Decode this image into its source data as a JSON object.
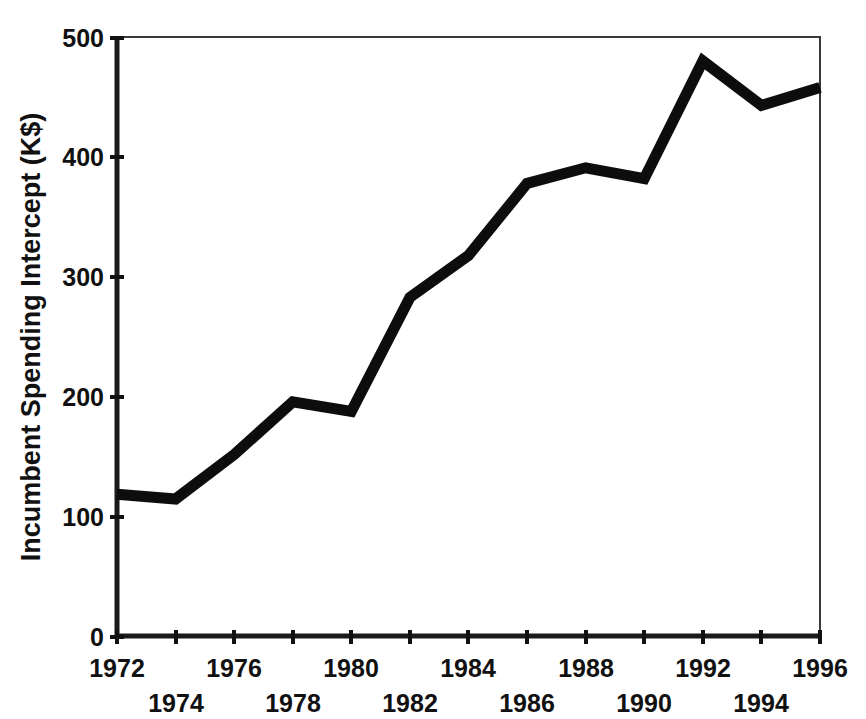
{
  "chart_data": {
    "type": "line",
    "title": "",
    "subtitle": "",
    "xlabel": "",
    "ylabel": "Incumbent Spending Intercept (K$)",
    "x": [
      1972,
      1974,
      1976,
      1978,
      1980,
      1982,
      1984,
      1986,
      1988,
      1990,
      1992,
      1994,
      1996
    ],
    "values": [
      119,
      115,
      152,
      196,
      188,
      283,
      318,
      378,
      391,
      382,
      480,
      443,
      458
    ],
    "series": [
      {
        "name": "Incumbent Spending Intercept",
        "values": [
          119,
          115,
          152,
          196,
          188,
          283,
          318,
          378,
          391,
          382,
          480,
          443,
          458
        ]
      }
    ],
    "xlim": [
      1972,
      1996
    ],
    "ylim": [
      0,
      500
    ],
    "x_tick_labels": [
      "1972",
      "1974",
      "1976",
      "1978",
      "1980",
      "1982",
      "1984",
      "1986",
      "1988",
      "1990",
      "1992",
      "1994",
      "1996"
    ],
    "x_tick_values": [
      1972,
      1974,
      1976,
      1978,
      1980,
      1982,
      1984,
      1986,
      1988,
      1990,
      1992,
      1994,
      1996
    ],
    "x_tick_rows": [
      0,
      1,
      0,
      1,
      0,
      1,
      0,
      1,
      0,
      1,
      0,
      1,
      0
    ],
    "y_tick_labels": [
      "0",
      "100",
      "200",
      "300",
      "400",
      "500"
    ],
    "y_tick_values": [
      0,
      100,
      200,
      300,
      400,
      500
    ],
    "grid": false,
    "legend": "none",
    "line_color": "#0d0d0d",
    "line_width": 11,
    "markers": false,
    "background_color": "#ffffff",
    "axis_color": "#111111"
  },
  "axes": {
    "y_axis_title": "Incumbent Spending Intercept (K$)",
    "x_axis_title": ""
  }
}
